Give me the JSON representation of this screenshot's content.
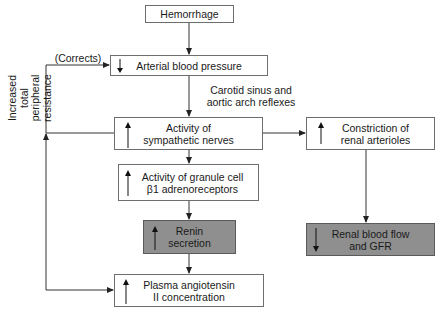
{
  "diagram": {
    "nodes": {
      "hemorrhage": {
        "label": "Hemorrhage",
        "indicator": ""
      },
      "arterial_bp": {
        "label": "Arterial blood pressure",
        "indicator": "down"
      },
      "sympathetic": {
        "label": "Activity of\nsympathetic nerves",
        "indicator": "up"
      },
      "renal_constriction": {
        "label": "Constriction of\nrenal arterioles",
        "indicator": "up"
      },
      "granule_cell": {
        "label": "Activity of granule cell\nβ1 adrenoreceptors",
        "indicator": "up"
      },
      "renin": {
        "label": "Renin\nsecretion",
        "indicator": "up",
        "shaded": true
      },
      "renal_flow": {
        "label": "Renal blood flow\nand GFR",
        "indicator": "down",
        "shaded": true
      },
      "angiotensin": {
        "label": "Plasma angiotensin\nII concentration",
        "indicator": "up"
      }
    },
    "edge_labels": {
      "reflexes": "Carotid sinus and\naortic arch reflexes",
      "corrects": "(Corrects)",
      "resistance": "Increased total\nperipheral\nresistance"
    },
    "edges": [
      [
        "hemorrhage",
        "arterial_bp"
      ],
      [
        "arterial_bp",
        "sympathetic"
      ],
      [
        "sympathetic",
        "renal_constriction"
      ],
      [
        "sympathetic",
        "granule_cell"
      ],
      [
        "granule_cell",
        "renin"
      ],
      [
        "renin",
        "angiotensin"
      ],
      [
        "renal_constriction",
        "renal_flow"
      ],
      [
        "sympathetic",
        "arterial_bp"
      ],
      [
        "angiotensin",
        "arterial_bp"
      ]
    ],
    "colors": {
      "line": "#333333",
      "box_border": "#6e6e6e",
      "shaded_fill": "#8f8f8f"
    }
  }
}
